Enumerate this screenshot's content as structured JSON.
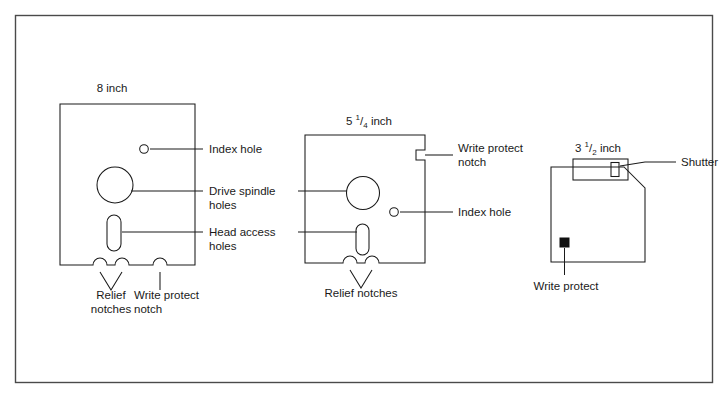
{
  "figure": {
    "background_color": "#ffffff",
    "line_color": "#1a1a1a",
    "frame_color": "#4a4a4a"
  },
  "disks": [
    {
      "id": "eight-inch",
      "size_label": {
        "whole": "8",
        "numerator": "",
        "denominator": "",
        "unit": "inch"
      },
      "size_label_text": "8 inch"
    },
    {
      "id": "five-quarter-inch",
      "size_label": {
        "whole": "5",
        "numerator": "1",
        "denominator": "4",
        "unit": "inch"
      },
      "size_label_text": "5 1/4 inch"
    },
    {
      "id": "three-half-inch",
      "size_label": {
        "whole": "3",
        "numerator": "1",
        "denominator": "2",
        "unit": "inch"
      },
      "size_label_text": "3 1/2 inch"
    }
  ],
  "callouts": {
    "index_hole_8": "Index hole",
    "drive_spindle_line1": "Drive spindle",
    "drive_spindle_line2": "holes",
    "head_access_line1": "Head access",
    "head_access_line2": "holes",
    "relief_notches_8_line1": "Relief",
    "relief_notches_8_line2": "notches",
    "write_protect_notch_8_line1": "Write protect",
    "write_protect_notch_8_line2": "notch",
    "write_protect_notch_525_line1": "Write protect",
    "write_protect_notch_525_line2": "notch",
    "index_hole_525": "Index hole",
    "relief_notches_525": "Relief notches",
    "shutter": "Shutter",
    "write_protect_35": "Write protect"
  }
}
